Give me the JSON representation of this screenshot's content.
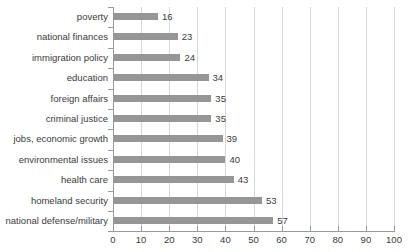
{
  "chart_data": {
    "type": "bar",
    "orientation": "horizontal",
    "title": "",
    "subtitle": "",
    "xlabel": "",
    "ylabel": "",
    "xlim": [
      0,
      100
    ],
    "xticks": [
      0,
      10,
      20,
      30,
      40,
      50,
      60,
      70,
      80,
      90,
      100
    ],
    "grid": true,
    "legend": null,
    "bar_color": "#969696",
    "gridline_color": "#d8d8d8",
    "axis_color": "#9a9a9a",
    "text_color": "#3b3b3b",
    "categories": [
      "poverty",
      "national finances",
      "immigration policy",
      "education",
      "foreign affairs",
      "criminal justice",
      "jobs, economic growth",
      "environmental issues",
      "health care",
      "homeland security",
      "national defense/military"
    ],
    "values": [
      16,
      23,
      24,
      34,
      35,
      35,
      39,
      40,
      43,
      53,
      57
    ],
    "data_labels": [
      "16",
      "23",
      "24",
      "34",
      "35",
      "35",
      "39",
      "40",
      "43",
      "53",
      "57"
    ]
  }
}
